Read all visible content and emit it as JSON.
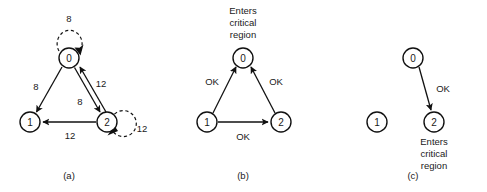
{
  "figure": {
    "panels": [
      {
        "id": "a",
        "caption": "(a)",
        "nodes": [
          {
            "id": "node-0",
            "label": "0"
          },
          {
            "id": "node-1",
            "label": "1"
          },
          {
            "id": "node-2",
            "label": "2"
          }
        ],
        "edges": [
          {
            "from": "0",
            "to": "1",
            "label": "8"
          },
          {
            "from": "0",
            "to": "2",
            "label": "8"
          },
          {
            "from": "2",
            "to": "0",
            "label": "12"
          },
          {
            "from": "2",
            "to": "1",
            "label": "12"
          }
        ],
        "self_loops": [
          {
            "at": "0",
            "label": "8"
          },
          {
            "at": "2",
            "label": "12"
          }
        ]
      },
      {
        "id": "b",
        "caption": "(b)",
        "nodes": [
          {
            "id": "node-0",
            "label": "0"
          },
          {
            "id": "node-1",
            "label": "1"
          },
          {
            "id": "node-2",
            "label": "2"
          }
        ],
        "edges": [
          {
            "from": "1",
            "to": "0",
            "label": "OK"
          },
          {
            "from": "2",
            "to": "0",
            "label": "OK"
          },
          {
            "from": "1",
            "to": "2",
            "label": "OK"
          }
        ],
        "annotation": {
          "target": "0",
          "lines": [
            "Enters",
            "critical",
            "region"
          ]
        }
      },
      {
        "id": "c",
        "caption": "(c)",
        "nodes": [
          {
            "id": "node-0",
            "label": "0"
          },
          {
            "id": "node-1",
            "label": "1"
          },
          {
            "id": "node-2",
            "label": "2"
          }
        ],
        "edges": [
          {
            "from": "0",
            "to": "2",
            "label": "OK"
          }
        ],
        "annotation": {
          "target": "2",
          "lines": [
            "Enters",
            "critical",
            "region"
          ]
        }
      }
    ],
    "colors": {
      "ink": "#111111",
      "background": "#ffffff"
    }
  }
}
